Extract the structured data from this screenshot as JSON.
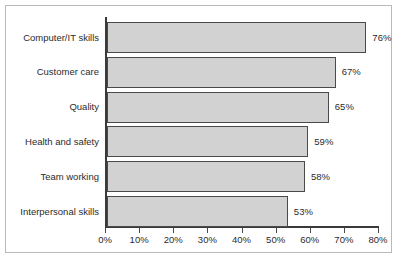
{
  "figure": {
    "frame_color": "#b9b9b9",
    "background": "#ffffff",
    "axis_color": "#3a3a3a",
    "bar_fill": "#d2d2d2",
    "bar_border": "#4a4a4a",
    "text_color": "#2b2b2b"
  },
  "chart_data": {
    "type": "bar",
    "orientation": "horizontal",
    "title": "",
    "subtitle": "",
    "xlabel": "",
    "ylabel": "",
    "xlim": [
      0,
      80
    ],
    "xtick_step": 10,
    "grid": false,
    "legend": null,
    "categories": [
      "Computer/IT skills",
      "Customer care",
      "Quality",
      "Health and safety",
      "Team working",
      "Interpersonal skills"
    ],
    "values": [
      76,
      67,
      65,
      59,
      58,
      53
    ],
    "data_labels": [
      "76%",
      "67%",
      "65%",
      "59%",
      "58%",
      "53%"
    ],
    "tick_labels": [
      "0%",
      "10%",
      "20%",
      "30%",
      "40%",
      "50%",
      "60%",
      "70%",
      "80%"
    ],
    "tick_values": [
      0,
      10,
      20,
      30,
      40,
      50,
      60,
      70,
      80
    ]
  }
}
